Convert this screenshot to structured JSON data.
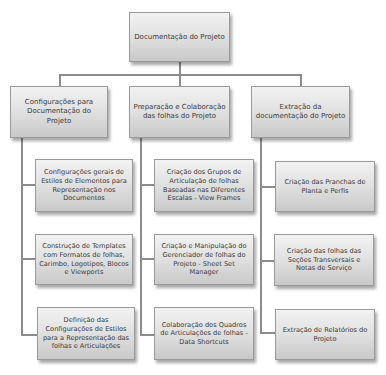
{
  "diagram": {
    "root": {
      "label": "Documentação do Projeto"
    },
    "branches": [
      {
        "label": "Configurações para Documentação do Projeto",
        "children": [
          {
            "label": "Configurações gerais de Estilos de Elementos para Representação nos Documentos"
          },
          {
            "label": "Construção de Templates com Formatos de folhas, Carimbo, Logotipos, Blocos e Viewports"
          },
          {
            "label": "Definição das Configurações de Estilos para a Representação das folhas e Articulações"
          }
        ]
      },
      {
        "label": "Preparação e Colaboração das folhas do Projeto",
        "children": [
          {
            "label": "Criação dos Grupos de Articulação de folhas Baseadas nas Diferentes Escalas - View Frames"
          },
          {
            "label": "Criação e Manipulação do Gerenciador de folhas do Projeto - Sheet Set Manager"
          },
          {
            "label": "Colaboração dos Quadros de Articulações de folhas - Data Shortcuts"
          }
        ]
      },
      {
        "label": "Extração da documentação do Projeto",
        "children": [
          {
            "label": "Criação das Pranchas de Planta e Perfis"
          },
          {
            "label": "Criação das folhas das Seções Transversais e Notas de Serviço"
          },
          {
            "label": "Extração de Relatórios do Projeto"
          }
        ]
      }
    ],
    "colors": {
      "node_top": "#f2f2f2",
      "node_bottom": "#c9c9c9",
      "node_border": "#9a9a9a",
      "text": "#3a3a3a",
      "connector": "#8c8c8c"
    }
  }
}
